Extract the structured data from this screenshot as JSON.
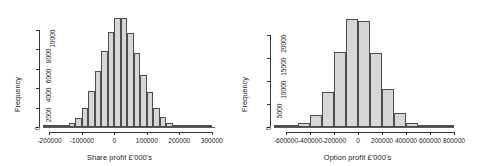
{
  "figure": {
    "background": "#ffffff",
    "bar_fill": "#d6d6d6",
    "bar_stroke": "#4d4d4d",
    "axis_color": "#333333"
  },
  "chart_data": [
    {
      "type": "bar",
      "subtype": "histogram",
      "title": "",
      "xlabel": "Share profit £'000's",
      "ylabel": "Frequency",
      "xlim": [
        -220000,
        310000
      ],
      "ylim": [
        0,
        11600
      ],
      "xticks": [
        -200000,
        -100000,
        0,
        100000,
        200000,
        300000
      ],
      "xticklabels": [
        "-200000",
        "-100000",
        "0",
        "100000",
        "200000",
        "300000"
      ],
      "yticks": [
        0,
        2000,
        4000,
        6000,
        8000,
        10000
      ],
      "yticklabels": [
        "0",
        "2000",
        "4000",
        "6000",
        "8000",
        "10000"
      ],
      "grid": false,
      "legend": null,
      "bin_width": 20000,
      "bin_starts": [
        -220000,
        -200000,
        -180000,
        -160000,
        -140000,
        -120000,
        -100000,
        -80000,
        -60000,
        -40000,
        -20000,
        0,
        20000,
        40000,
        60000,
        80000,
        100000,
        120000,
        140000,
        160000,
        180000,
        200000,
        220000,
        240000,
        260000,
        280000
      ],
      "values": [
        20,
        40,
        90,
        180,
        380,
        900,
        1950,
        3700,
        5750,
        7850,
        9750,
        11150,
        11200,
        9600,
        7600,
        5350,
        3550,
        2000,
        1050,
        420,
        170,
        70,
        35,
        20,
        10,
        5
      ]
    },
    {
      "type": "bar",
      "subtype": "histogram",
      "title": "",
      "xlabel": "Option profit £'000's",
      "ylabel": "Frequency",
      "xlim": [
        -700000,
        800000
      ],
      "ylim": [
        0,
        24500
      ],
      "xticks": [
        -600000,
        -400000,
        -200000,
        0,
        200000,
        400000,
        600000,
        800000
      ],
      "xticklabels": [
        "-600000",
        "-400000",
        "-200000",
        "0",
        "200000",
        "400000",
        "600000",
        "800000"
      ],
      "yticks": [
        0,
        5000,
        10000,
        15000,
        20000
      ],
      "yticklabels": [
        "0",
        "5000",
        "10000",
        "15000",
        "20000"
      ],
      "grid": false,
      "legend": null,
      "bin_width": 100000,
      "bin_starts": [
        -700000,
        -600000,
        -500000,
        -400000,
        -300000,
        -200000,
        -100000,
        0,
        100000,
        200000,
        300000,
        400000,
        500000,
        600000,
        700000
      ],
      "values": [
        60,
        250,
        800,
        2700,
        7500,
        16200,
        23400,
        23000,
        16100,
        8200,
        3100,
        900,
        250,
        90,
        30
      ]
    }
  ]
}
